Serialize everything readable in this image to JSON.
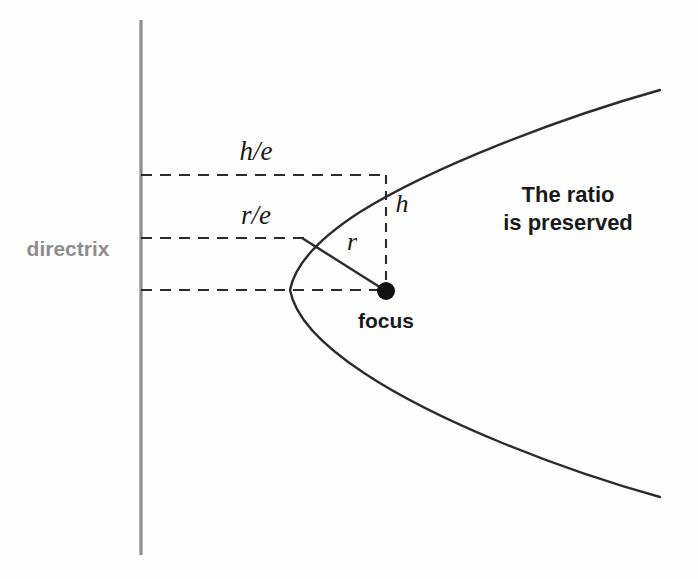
{
  "figure": {
    "background_color": "#fefefe",
    "ink_color": "#2b2b2b",
    "directrix_color": "#8d8d8d",
    "annotation_color": "#1a1a1a"
  },
  "labels": {
    "directrix": "directrix",
    "h_over_e": "h/e",
    "r_over_e": "r/e",
    "r": "r",
    "h": "h",
    "focus": "focus",
    "note_line1": "The ratio",
    "note_line2": "is preserved"
  },
  "geometry": {
    "directrix_line": {
      "x": 141,
      "y_top": 20,
      "y_bottom": 555
    },
    "focus_point": {
      "x": 386,
      "y": 291,
      "radius": 9
    },
    "vertex_point": {
      "x": 290,
      "y": 290
    },
    "curve_upper_end": {
      "x": 660,
      "y": 90
    },
    "curve_lower_end": {
      "x": 660,
      "y": 497
    },
    "point_on_curve_upper": {
      "x": 386,
      "y": 175
    },
    "point_on_curve_mid": {
      "x": 302,
      "y": 238
    },
    "dashed_line_h_over_e": {
      "y": 175,
      "x_from": 141,
      "x_to": 386
    },
    "dashed_line_r_over_e": {
      "y": 238,
      "x_from": 141,
      "x_to": 302
    },
    "dashed_line_axis": {
      "y": 290,
      "x_from": 141,
      "x_to": 380
    },
    "dashed_segment_h": {
      "x": 386,
      "y_from": 175,
      "y_to": 283
    }
  },
  "label_positions": {
    "directrix": {
      "x": 68,
      "y": 256
    },
    "h_over_e": {
      "x": 256,
      "y": 160
    },
    "r_over_e": {
      "x": 256,
      "y": 224
    },
    "r": {
      "x": 352,
      "y": 250
    },
    "h": {
      "x": 402,
      "y": 212
    },
    "focus": {
      "x": 386,
      "y": 328
    },
    "note_line1": {
      "x": 568,
      "y": 202
    },
    "note_line2": {
      "x": 568,
      "y": 230
    }
  },
  "font_sizes": {
    "directrix": 21,
    "ratio_labels": 27,
    "variable_labels": 26,
    "focus": 21,
    "note": 22
  }
}
